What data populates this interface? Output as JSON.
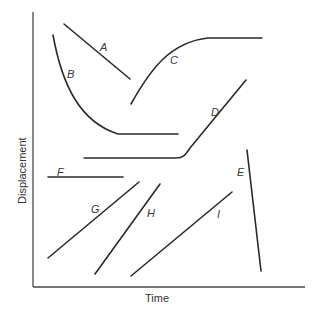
{
  "diagram": {
    "type": "displacement-time graph",
    "axes": {
      "x_label": "Time",
      "y_label": "Displacement"
    },
    "curves": [
      {
        "id": "A",
        "label": "A",
        "shape": "straight line, decreasing",
        "path": "M64,24 L130,79",
        "label_pos": [
          100,
          51
        ]
      },
      {
        "id": "B",
        "label": "B",
        "shape": "decreasing curve leveling to flat",
        "path": "M53,35 C62,85 80,122 118,134 L178,134",
        "label_pos": [
          67,
          78
        ]
      },
      {
        "id": "C",
        "label": "C",
        "shape": "increasing curve leveling to flat",
        "path": "M131,104 C150,70 170,42 208,38 L262,38",
        "label_pos": [
          170,
          64
        ]
      },
      {
        "id": "D",
        "label": "D",
        "shape": "flat then increasing",
        "path": "M84,158 L176,158 C184,158 186,154 190,148 L246,80",
        "label_pos": [
          211,
          116
        ]
      },
      {
        "id": "E",
        "label": "E",
        "shape": "steep straight line, decreasing",
        "path": "M247,150 L261,271",
        "label_pos": [
          237,
          176
        ]
      },
      {
        "id": "F",
        "label": "F",
        "shape": "horizontal line",
        "path": "M48,177 L123,177",
        "label_pos": [
          57,
          176
        ]
      },
      {
        "id": "G",
        "label": "G",
        "shape": "straight line, increasing",
        "path": "M48,258 L139,182",
        "label_pos": [
          91,
          213
        ]
      },
      {
        "id": "H",
        "label": "H",
        "shape": "steep straight line, increasing",
        "path": "M95,274 L160,184",
        "label_pos": [
          147,
          217
        ]
      },
      {
        "id": "I",
        "label": "I",
        "shape": "straight line, increasing",
        "path": "M131,276 L232,192",
        "label_pos": [
          217,
          218
        ]
      }
    ]
  }
}
